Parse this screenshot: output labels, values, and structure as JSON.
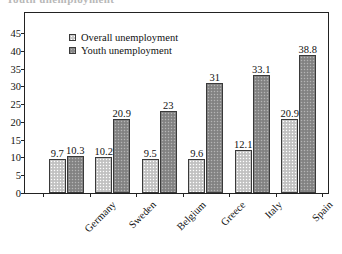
{
  "title": "Youth unemployment",
  "legend": [
    {
      "key": "overall",
      "label": "Overall unemployment"
    },
    {
      "key": "youth",
      "label": "Youth unemployment"
    }
  ],
  "axis": {
    "yticks": [
      "0",
      "5",
      "10",
      "15",
      "20",
      "25",
      "30",
      "35",
      "40",
      "45"
    ]
  },
  "chart_data": {
    "type": "bar",
    "title": "Youth unemployment",
    "xlabel": "",
    "ylabel": "",
    "ylim": [
      0,
      45
    ],
    "ytick_step": 5,
    "grid": false,
    "legend_position": "top-left",
    "categories": [
      "Germany",
      "Sweden",
      "Belgium",
      "Greece",
      "Italy",
      "Spain"
    ],
    "series": [
      {
        "name": "Overall unemployment",
        "values": [
          9.7,
          10.2,
          9.5,
          9.6,
          12.1,
          20.9
        ]
      },
      {
        "name": "Youth unemployment",
        "values": [
          10.3,
          20.9,
          23,
          31,
          33.1,
          38.8
        ]
      }
    ],
    "value_labels": {
      "Overall unemployment": [
        "9.7",
        "10.2",
        "9.5",
        "9.6",
        "12.1",
        "20.9"
      ],
      "Youth unemployment": [
        "10.3",
        "20.9",
        "23",
        "31",
        "33.1",
        "38.8"
      ]
    }
  },
  "colors": {
    "overall_bar": "#c9c9c9",
    "youth_bar": "#8a8a8a",
    "bar_outline": "#3a3a3a",
    "axis": "#222222",
    "text": "#111111"
  }
}
